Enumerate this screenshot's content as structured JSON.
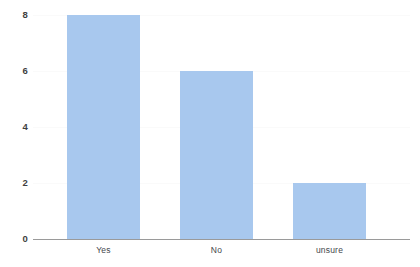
{
  "chart_data": {
    "type": "bar",
    "title": "",
    "subtitle": "",
    "xlabel": "",
    "ylabel": "",
    "categories": [
      "Yes",
      "No",
      "unsure"
    ],
    "values": [
      8,
      6,
      2
    ],
    "series": [
      {
        "name": "",
        "values": [
          8,
          6,
          2
        ]
      }
    ],
    "ylim": [
      0,
      8
    ],
    "yticks": [
      0,
      2,
      4,
      6,
      8
    ],
    "ytick_labels": [
      "0",
      "2",
      "4",
      "6",
      "8"
    ],
    "grid": true,
    "grid_axis": "y",
    "legend": false,
    "legend_position": "none",
    "annotations": [],
    "bar_color": "#a8c8ee",
    "axis_color": "#9a9a9a",
    "gridline_color": "#fafafa",
    "tick_label_color": "#3f3f3f",
    "category_label_color": "#44474c",
    "background_color": "#ffffff"
  }
}
